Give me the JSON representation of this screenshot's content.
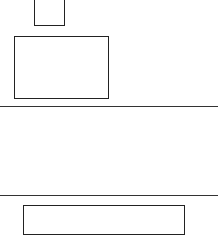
{
  "page": {
    "background": "#ffffff",
    "stroke_color": "#222222"
  },
  "top_box": {
    "label": ""
  },
  "main_box": {
    "label": ""
  },
  "section": {
    "label": ""
  },
  "bottom_box": {
    "label": ""
  }
}
